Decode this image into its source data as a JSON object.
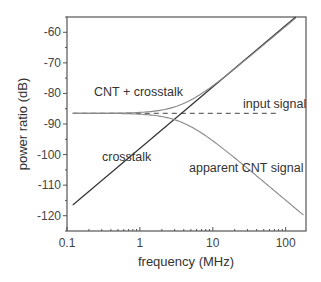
{
  "chart_data": {
    "type": "line",
    "title": "",
    "xlabel": "frequency (MHz)",
    "ylabel": "power ratio (dB)",
    "xscale": "log",
    "xlim": [
      0.1,
      190
    ],
    "ylim": [
      -125,
      -55
    ],
    "xticks": [
      0.1,
      1,
      10,
      100
    ],
    "xtick_labels": [
      "0.1",
      "1",
      "10",
      "100"
    ],
    "yticks": [
      -60,
      -70,
      -80,
      -90,
      -100,
      -110,
      -120
    ],
    "ytick_labels": [
      "-60",
      "-70",
      "-80",
      "-90",
      "-100",
      "-110",
      "-120"
    ],
    "grid": false,
    "legend": null,
    "series": [
      {
        "name": "input signal",
        "style": "dashed",
        "x": [
          0.12,
          80
        ],
        "y": [
          -86.5,
          -86.5
        ]
      },
      {
        "name": "crosstalk",
        "style": "solid",
        "x": [
          0.12,
          1,
          10,
          100,
          137
        ],
        "y": [
          -116.5,
          -98.1,
          -78.1,
          -58.1,
          -55.0
        ]
      },
      {
        "name": "CNT + crosstalk",
        "style": "solid",
        "x": [
          0.12,
          0.5,
          1,
          2,
          3,
          5,
          10,
          20,
          50,
          137
        ],
        "y": [
          -86.5,
          -86.3,
          -85.9,
          -84.8,
          -83.5,
          -80.9,
          -76.9,
          -71.5,
          -63.8,
          -55.0
        ]
      },
      {
        "name": "apparent CNT signal",
        "style": "solid",
        "x": [
          0.12,
          0.5,
          1,
          2,
          3,
          5,
          10,
          20,
          50,
          100,
          175
        ],
        "y": [
          -86.5,
          -86.7,
          -87.1,
          -88.2,
          -89.5,
          -92.1,
          -96.1,
          -101.5,
          -109.2,
          -115.8,
          -124.7
        ]
      }
    ],
    "annotations": [
      {
        "text": "CNT + crosstalk",
        "x": 0.28,
        "y": -81
      },
      {
        "text": "input signal",
        "x": 18,
        "y": -84
      },
      {
        "text": "crosstalk",
        "x": 0.4,
        "y": -100
      },
      {
        "text": "apparent CNT signal",
        "x": 9,
        "y": -104
      }
    ]
  },
  "labels": {
    "xlabel": "frequency (MHz)",
    "ylabel": "power ratio (dB)",
    "annot_sum": "CNT + crosstalk",
    "annot_input": "input signal",
    "annot_crosstalk": "crosstalk",
    "annot_apparent": "apparent CNT signal"
  },
  "colors": {
    "axis": "#555555",
    "crosstalk": "#333333",
    "curves": "#888888",
    "dashed": "#444444"
  }
}
